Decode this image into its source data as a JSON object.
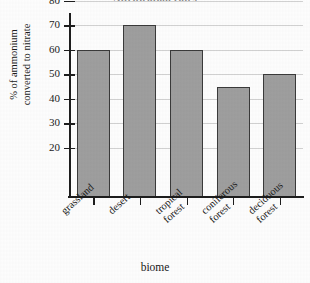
{
  "chart_data": {
    "type": "bar",
    "title": "Nitrification rates",
    "xlabel": "biome",
    "ylabel": "% of ammonium converted to nitrate",
    "ylabel_lines": [
      "% of ammonium",
      "converted to nitrate"
    ],
    "categories": [
      "grassland",
      "desert",
      "tropical forest",
      "coniferous forest",
      "deciduous forest"
    ],
    "category_lines": [
      [
        "grassland"
      ],
      [
        "desert"
      ],
      [
        "tropical",
        "forest"
      ],
      [
        "coniferous",
        "forest"
      ],
      [
        "deciduous",
        "forest"
      ]
    ],
    "values": [
      60,
      70,
      60,
      45,
      50
    ],
    "ylim": [
      0,
      85
    ],
    "yticks": [
      20,
      30,
      40,
      50,
      60,
      70,
      80
    ],
    "ytick_labels": [
      "20",
      "30",
      "40",
      "50",
      "60",
      "70",
      "80"
    ],
    "grid": true,
    "grid_axis": "y",
    "legend": null,
    "bar_color": "#9e9e9e",
    "bar_edge_color": "#3a3a3a",
    "grid_color": "#d2d2d2",
    "axis_color": "#1d1d1d",
    "background_color": "#fdfdfd"
  }
}
